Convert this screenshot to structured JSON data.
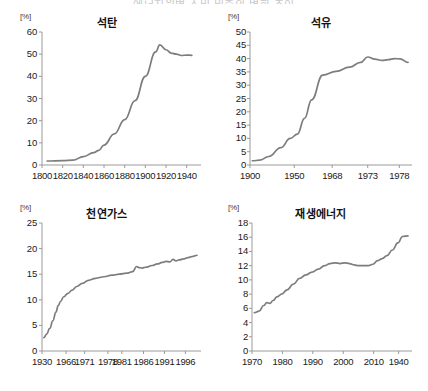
{
  "page": {
    "clipped_header_text": "에너지원별 소비 비중의 변화 추이"
  },
  "style": {
    "line_color": "#7d7d7d",
    "axis_color": "#9a9a9a",
    "text_color": "#1a1a1a",
    "background": "#ffffff"
  },
  "chart_data": [
    {
      "id": "coal",
      "type": "line",
      "title": "석탄",
      "unit_label": "[%]",
      "xlabel": "",
      "ylabel": "",
      "ylim": [
        0,
        60
      ],
      "yticks": [
        0,
        10,
        20,
        30,
        40,
        50,
        60
      ],
      "xlim": [
        1800,
        1950
      ],
      "xticks": [
        1800,
        1820,
        1840,
        1860,
        1880,
        1900,
        1920,
        1940
      ],
      "grid": false,
      "legend": "none",
      "x": [
        1805,
        1820,
        1830,
        1840,
        1850,
        1855,
        1860,
        1870,
        1880,
        1890,
        1900,
        1910,
        1914,
        1920,
        1925,
        1930,
        1935,
        1940,
        1945
      ],
      "values": [
        1.8,
        2.0,
        2.2,
        3.8,
        5.6,
        6.6,
        9.0,
        14.0,
        20.5,
        29.0,
        40.0,
        51.0,
        54.2,
        52.0,
        50.5,
        50.0,
        49.4,
        49.6,
        49.5
      ]
    },
    {
      "id": "oil",
      "type": "line",
      "title": "석유",
      "unit_label": "[%]",
      "xlabel": "",
      "ylabel": "",
      "ylim": [
        0,
        50
      ],
      "yticks": [
        0,
        5,
        10,
        15,
        20,
        25,
        30,
        35,
        40,
        45,
        50
      ],
      "xtick_positions": [
        0.0,
        0.28,
        0.52,
        0.745,
        0.945
      ],
      "xticks": [
        1900,
        1950,
        1968,
        1973,
        1978
      ],
      "grid": false,
      "legend": "none",
      "x_frac": [
        0.015,
        0.06,
        0.12,
        0.195,
        0.255,
        0.3,
        0.345,
        0.39,
        0.46,
        0.545,
        0.63,
        0.7,
        0.745,
        0.79,
        0.835,
        0.875,
        0.915,
        0.95,
        1.0
      ],
      "values": [
        1.6,
        1.8,
        3.2,
        6.5,
        10.0,
        11.6,
        17.5,
        24.5,
        33.8,
        35.2,
        36.8,
        38.6,
        40.6,
        39.8,
        39.3,
        39.6,
        40.0,
        39.9,
        38.6
      ]
    },
    {
      "id": "natural-gas",
      "type": "line",
      "title": "천연가스",
      "unit_label": "[%]",
      "xlabel": "",
      "ylabel": "",
      "ylim": [
        0,
        25
      ],
      "yticks": [
        0,
        5,
        10,
        15,
        20,
        25
      ],
      "xtick_positions": [
        0.0,
        0.155,
        0.275,
        0.425,
        0.515,
        0.655,
        0.79,
        0.925
      ],
      "xticks": [
        1930,
        1966,
        1971,
        1978,
        1981,
        1986,
        1991,
        1996
      ],
      "grid": false,
      "legend": "none",
      "x_frac": [
        0.012,
        0.03,
        0.05,
        0.07,
        0.09,
        0.105,
        0.12,
        0.14,
        0.165,
        0.195,
        0.225,
        0.26,
        0.3,
        0.345,
        0.4,
        0.45,
        0.5,
        0.545,
        0.585,
        0.61,
        0.625,
        0.645,
        0.675,
        0.71,
        0.745,
        0.775,
        0.8,
        0.825,
        0.845,
        0.865,
        0.885,
        0.915,
        0.95,
        0.975,
        1.0
      ],
      "values": [
        2.6,
        3.3,
        4.4,
        5.9,
        7.6,
        8.9,
        9.7,
        10.6,
        11.2,
        11.9,
        12.6,
        13.2,
        13.8,
        14.2,
        14.5,
        14.8,
        15.0,
        15.2,
        15.5,
        16.5,
        16.3,
        16.2,
        16.4,
        16.7,
        17.0,
        17.3,
        17.5,
        17.4,
        17.9,
        17.6,
        17.8,
        18.0,
        18.3,
        18.5,
        18.7
      ]
    },
    {
      "id": "renewable",
      "type": "line",
      "title": "재생에너지",
      "unit_label": "[%]",
      "xlabel": "",
      "ylabel": "",
      "ylim": [
        0,
        18
      ],
      "yticks": [
        0,
        2,
        4,
        6,
        8,
        10,
        12,
        14,
        16,
        18
      ],
      "xtick_positions": [
        0.0,
        0.195,
        0.39,
        0.585,
        0.78,
        0.94
      ],
      "xticks": [
        1970,
        1980,
        1990,
        2000,
        2010,
        1940
      ],
      "grid": false,
      "legend": "none",
      "x_frac": [
        0.015,
        0.045,
        0.075,
        0.095,
        0.115,
        0.135,
        0.16,
        0.19,
        0.225,
        0.265,
        0.305,
        0.345,
        0.385,
        0.425,
        0.465,
        0.5,
        0.535,
        0.565,
        0.595,
        0.625,
        0.655,
        0.685,
        0.715,
        0.745,
        0.775,
        0.805,
        0.835,
        0.865,
        0.9,
        0.935,
        0.965,
        1.0
      ],
      "values": [
        5.4,
        5.6,
        6.4,
        6.8,
        6.7,
        7.1,
        7.6,
        8.0,
        8.6,
        9.4,
        10.2,
        10.7,
        11.1,
        11.5,
        12.0,
        12.3,
        12.4,
        12.3,
        12.4,
        12.3,
        12.1,
        12.0,
        12.0,
        12.0,
        12.2,
        12.7,
        13.0,
        13.4,
        14.2,
        15.2,
        16.1,
        16.2
      ]
    }
  ]
}
